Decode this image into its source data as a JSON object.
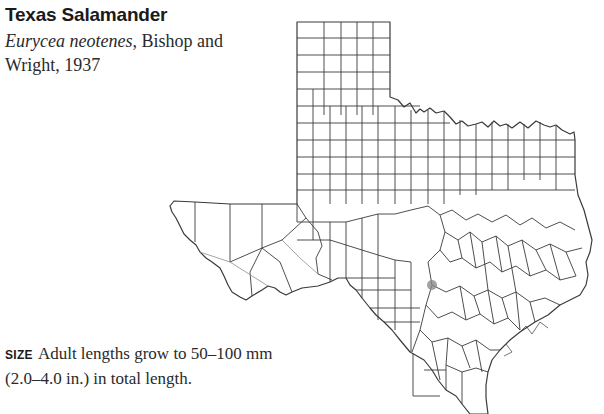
{
  "species": {
    "common_name": "Texas Salamander",
    "scientific_name": "Eurycea neotenes",
    "authority": ", Bishop and Wright, 1937"
  },
  "size": {
    "label": "SIZE",
    "text": "Adult lengths grow to 50–100 mm (2.0–4.0 in.) in total length."
  },
  "map": {
    "region": "Texas county map",
    "marker": {
      "x": 432,
      "y": 285,
      "color": "#8a8a8a"
    },
    "line_color": "#3a3a3a"
  }
}
